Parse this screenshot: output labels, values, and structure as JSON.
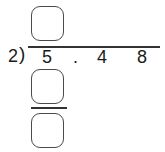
{
  "problem": {
    "divisor": "2",
    "bracket": ")",
    "dividend_digits": [
      "5",
      ".",
      "4",
      "8"
    ]
  },
  "answer_boxes": {
    "quotient": "",
    "product": "",
    "difference": ""
  }
}
